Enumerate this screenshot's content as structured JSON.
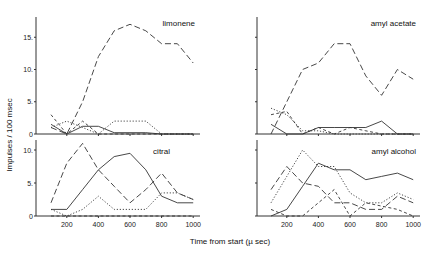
{
  "chart_data": [
    {
      "type": "line",
      "title": "limonene",
      "xlabel": "Time from start (µsec)",
      "ylabel": "Impulses / 100 msec",
      "x": [
        100,
        200,
        300,
        400,
        500,
        600,
        700,
        800,
        900,
        1000
      ],
      "xticks": [
        200,
        400,
        600,
        800,
        1000
      ],
      "yticks": [
        "0",
        "5",
        "10",
        "15"
      ],
      "ylim": [
        0,
        18
      ],
      "series": [
        {
          "name": "long-dash",
          "style": "dash",
          "values": [
            1,
            0,
            5,
            12,
            16,
            17,
            16,
            14,
            14,
            11
          ]
        },
        {
          "name": "solid",
          "style": "solid",
          "values": [
            1.5,
            0,
            1.2,
            1.2,
            0.2,
            0.2,
            0.2,
            0,
            0,
            0
          ]
        },
        {
          "name": "dotted",
          "style": "dot",
          "values": [
            1,
            2,
            1,
            0,
            2,
            2,
            2,
            0,
            0,
            0
          ]
        },
        {
          "name": "short-dash",
          "style": "shortdash",
          "values": [
            3,
            0,
            2,
            0,
            0,
            0,
            0,
            0,
            0,
            0
          ]
        }
      ]
    },
    {
      "type": "line",
      "title": "amyl acetate",
      "x": [
        100,
        200,
        300,
        400,
        500,
        600,
        700,
        800,
        900,
        1000
      ],
      "xticks": [
        200,
        400,
        600,
        800,
        1000
      ],
      "ylim": [
        0,
        18
      ],
      "series": [
        {
          "name": "long-dash",
          "style": "dash",
          "values": [
            0,
            5,
            10,
            11,
            14,
            14,
            9,
            6,
            10,
            8.5
          ]
        },
        {
          "name": "solid",
          "style": "solid",
          "values": [
            1.5,
            0,
            0,
            1,
            1,
            1,
            1,
            2,
            0,
            0
          ]
        },
        {
          "name": "dotted",
          "style": "dot",
          "values": [
            4,
            3,
            0.5,
            0.5,
            0,
            0,
            0,
            0,
            0,
            0
          ]
        },
        {
          "name": "short-dash",
          "style": "shortdash",
          "values": [
            3,
            3.5,
            0,
            1,
            0,
            1,
            0.5,
            0,
            0,
            0
          ]
        }
      ]
    },
    {
      "type": "line",
      "title": "citral",
      "x": [
        100,
        200,
        300,
        400,
        500,
        600,
        700,
        800,
        900,
        1000
      ],
      "xticks": [
        200,
        400,
        600,
        800,
        1000
      ],
      "yticks": [
        "0",
        "5",
        "10"
      ],
      "ylim": [
        0,
        11
      ],
      "series": [
        {
          "name": "long-dash",
          "style": "dash",
          "values": [
            2,
            8,
            11,
            7,
            4.5,
            2,
            4,
            6.5,
            3.5,
            2.5
          ]
        },
        {
          "name": "solid",
          "style": "solid",
          "values": [
            1,
            1,
            4,
            7,
            9,
            9.5,
            7,
            3,
            2,
            2
          ]
        },
        {
          "name": "dotted",
          "style": "dot",
          "values": [
            1,
            0,
            1,
            3,
            1,
            1,
            1,
            3.5,
            3.5,
            2.5
          ]
        },
        {
          "name": "short-dash",
          "style": "shortdash",
          "values": [
            0,
            0,
            0,
            0,
            0,
            0,
            0,
            0,
            0,
            0
          ]
        }
      ]
    },
    {
      "type": "line",
      "title": "amyl alcohol",
      "x": [
        100,
        200,
        300,
        400,
        500,
        600,
        700,
        800,
        900,
        1000
      ],
      "xticks": [
        200,
        400,
        600,
        800,
        1000
      ],
      "ylim": [
        0,
        11
      ],
      "series": [
        {
          "name": "long-dash",
          "style": "dash",
          "values": [
            4,
            7.5,
            5,
            4.5,
            2,
            2,
            1,
            1,
            3,
            2
          ]
        },
        {
          "name": "solid",
          "style": "solid",
          "values": [
            0,
            1,
            4.5,
            8,
            7,
            7,
            5.5,
            6,
            6.5,
            5.5
          ]
        },
        {
          "name": "dotted",
          "style": "dot",
          "values": [
            2,
            6,
            10,
            7.5,
            7.5,
            3.5,
            2,
            2,
            3.5,
            2.5
          ]
        },
        {
          "name": "short-dash",
          "style": "shortdash",
          "values": [
            1,
            0,
            0,
            2,
            4,
            0,
            2,
            1.5,
            1,
            0
          ]
        }
      ]
    }
  ],
  "labels": {
    "ylabel": "Impulses / 100 msec",
    "xlabel": "Time   from   start   (µ sec)",
    "titles": [
      "limonene",
      "amyl acetate",
      "citral",
      "amyl alcohol"
    ],
    "yticks_top": [
      "15",
      "10",
      "5",
      "0"
    ],
    "yticks_bottom": [
      "10",
      "5",
      "0"
    ],
    "xticks": [
      "200",
      "400",
      "600",
      "800",
      "1000"
    ]
  }
}
